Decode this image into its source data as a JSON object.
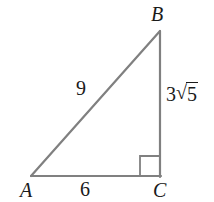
{
  "figure": {
    "type": "right-triangle-diagram",
    "background_color": "#ffffff",
    "stroke_color": "#808080",
    "label_color": "#1a1a1a",
    "width": 214,
    "height": 202
  },
  "vertices": {
    "a": {
      "label": "A",
      "x": 31,
      "y": 176
    },
    "b": {
      "label": "B",
      "x": 160,
      "y": 31
    },
    "c": {
      "label": "C",
      "x": 160,
      "y": 176
    }
  },
  "sides": {
    "hypotenuse": {
      "label": "9",
      "from": "A",
      "to": "B"
    },
    "base": {
      "label": "6",
      "from": "A",
      "to": "C"
    },
    "vertical": {
      "label": "3√5",
      "coefficient": "3",
      "radical_sign": "√",
      "radicand": "5",
      "from": "B",
      "to": "C"
    }
  },
  "right_angle": {
    "at_vertex": "C",
    "marker_size": 20,
    "marker_x": 140,
    "marker_y": 156
  },
  "geometry": {
    "polygon_points": "31,176 160,31 160,176"
  }
}
